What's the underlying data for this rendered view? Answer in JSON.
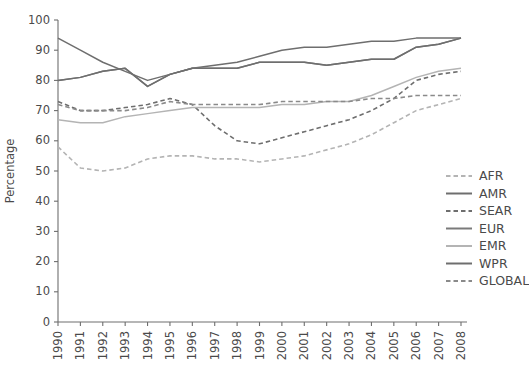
{
  "chart_data": {
    "type": "line",
    "title": "",
    "xlabel": "",
    "ylabel": "Percentage",
    "xlim": [
      1990,
      2008
    ],
    "ylim": [
      0,
      100
    ],
    "yticks": [
      0,
      10,
      20,
      30,
      40,
      50,
      60,
      70,
      80,
      90,
      100
    ],
    "grid": false,
    "legend_position": "right",
    "x": [
      1990,
      1991,
      1992,
      1993,
      1994,
      1995,
      1996,
      1997,
      1998,
      1999,
      2000,
      2001,
      2002,
      2003,
      2004,
      2005,
      2006,
      2007,
      2008
    ],
    "series": [
      {
        "name": "AFR",
        "style": "dashed",
        "color": "#b4b4b4",
        "values": [
          58,
          51,
          50,
          51,
          54,
          55,
          55,
          54,
          54,
          53,
          54,
          55,
          57,
          59,
          62,
          66,
          70,
          72,
          74
        ]
      },
      {
        "name": "AMR",
        "style": "solid",
        "color": "#6e6e6e",
        "values": [
          94,
          90,
          86,
          83,
          80,
          82,
          84,
          85,
          86,
          88,
          90,
          91,
          91,
          92,
          93,
          93,
          94,
          94,
          94
        ]
      },
      {
        "name": "SEAR",
        "style": "dashed",
        "color": "#6e6e6e",
        "values": [
          73,
          70,
          70,
          71,
          72,
          74,
          72,
          65,
          60,
          59,
          61,
          63,
          65,
          67,
          70,
          74,
          80,
          82,
          83
        ]
      },
      {
        "name": "EUR",
        "style": "solid",
        "color": "#7a7a7a",
        "values": [
          80,
          81,
          83,
          84,
          78,
          82,
          84,
          84,
          84,
          86,
          86,
          86,
          85,
          86,
          87,
          87,
          91,
          92,
          94
        ]
      },
      {
        "name": "EMR",
        "style": "solid",
        "color": "#b4b4b4",
        "values": [
          67,
          66,
          66,
          68,
          69,
          70,
          71,
          71,
          71,
          71,
          72,
          72,
          73,
          73,
          75,
          78,
          81,
          83,
          84
        ]
      },
      {
        "name": "WPR",
        "style": "solid",
        "color": "#6e6e6e",
        "values": [
          80,
          81,
          83,
          84,
          78,
          82,
          84,
          84,
          84,
          86,
          86,
          86,
          85,
          86,
          87,
          87,
          91,
          92,
          94
        ]
      },
      {
        "name": "GLOBAL",
        "style": "dashed",
        "color": "#8a8a8a",
        "values": [
          72,
          70,
          70,
          70,
          71,
          73,
          72,
          72,
          72,
          72,
          73,
          73,
          73,
          73,
          74,
          74,
          75,
          75,
          75
        ]
      }
    ]
  },
  "legend": {
    "items": [
      {
        "label": "AFR"
      },
      {
        "label": "AMR"
      },
      {
        "label": "SEAR"
      },
      {
        "label": "EUR"
      },
      {
        "label": "EMR"
      },
      {
        "label": "WPR"
      },
      {
        "label": "GLOBAL"
      }
    ]
  },
  "axes": {
    "y_title": "Percentage",
    "y_ticklabels": [
      "0",
      "10",
      "20",
      "30",
      "40",
      "50",
      "60",
      "70",
      "80",
      "90",
      "100"
    ],
    "x_ticklabels": [
      "1990",
      "1991",
      "1992",
      "1993",
      "1994",
      "1995",
      "1996",
      "1997",
      "1998",
      "1999",
      "2000",
      "2001",
      "2002",
      "2003",
      "2004",
      "2005",
      "2006",
      "2007",
      "2008"
    ]
  }
}
